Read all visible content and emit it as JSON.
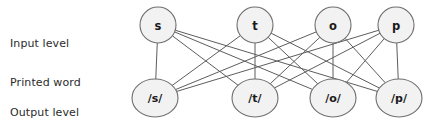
{
  "diagram": {
    "labels": {
      "input_line1": "Input level",
      "input_line2": "Printed word",
      "output_line1": "Output level",
      "output_line2": "Spoken word"
    },
    "colors": {
      "node_fill": "#f2f2f2",
      "node_stroke": "#6e6e6e",
      "edge": "#5d5d5d",
      "text": "#1a1a1a",
      "background": "#ffffff"
    },
    "input_nodes": [
      {
        "id": "s",
        "label": "s",
        "cx": 158,
        "cy": 25,
        "r": 18
      },
      {
        "id": "t",
        "label": "t",
        "cx": 255,
        "cy": 25,
        "r": 18
      },
      {
        "id": "o",
        "label": "o",
        "cx": 333,
        "cy": 25,
        "r": 18
      },
      {
        "id": "p",
        "label": "p",
        "cx": 396,
        "cy": 25,
        "r": 18
      }
    ],
    "output_nodes": [
      {
        "id": "ps",
        "label": "/s/",
        "cx": 155,
        "cy": 98,
        "rx": 23,
        "ry": 19
      },
      {
        "id": "pt",
        "label": "/t/",
        "cx": 255,
        "cy": 98,
        "rx": 23,
        "ry": 19
      },
      {
        "id": "po",
        "label": "/o/",
        "cx": 333,
        "cy": 98,
        "rx": 23,
        "ry": 19
      },
      {
        "id": "pp",
        "label": "/p/",
        "cx": 399,
        "cy": 98,
        "rx": 23,
        "ry": 19
      }
    ],
    "edges": [
      {
        "from": "s",
        "to": "ps"
      },
      {
        "from": "s",
        "to": "pt"
      },
      {
        "from": "s",
        "to": "po"
      },
      {
        "from": "s",
        "to": "pp"
      },
      {
        "from": "t",
        "to": "ps"
      },
      {
        "from": "t",
        "to": "pt"
      },
      {
        "from": "t",
        "to": "po"
      },
      {
        "from": "t",
        "to": "pp"
      },
      {
        "from": "o",
        "to": "ps"
      },
      {
        "from": "o",
        "to": "pt"
      },
      {
        "from": "o",
        "to": "po"
      },
      {
        "from": "o",
        "to": "pp"
      },
      {
        "from": "p",
        "to": "ps"
      },
      {
        "from": "p",
        "to": "pt"
      },
      {
        "from": "p",
        "to": "po"
      },
      {
        "from": "p",
        "to": "pp"
      }
    ],
    "edge_count": 16,
    "connectivity": "fully-connected bipartite"
  }
}
